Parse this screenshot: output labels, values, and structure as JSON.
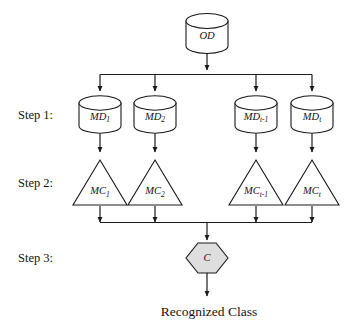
{
  "diagram": {
    "background_color": "#ffffff",
    "stroke_color": "#1a1a1a",
    "hexagon_fill": "#dedede",
    "source": {
      "id": "OD",
      "label": "OD",
      "shape": "cylinder"
    },
    "steps": [
      {
        "id": "step1",
        "label": "Step 1:"
      },
      {
        "id": "step2",
        "label": "Step 2:"
      },
      {
        "id": "step3",
        "label": "Step 3:"
      }
    ],
    "step1_nodes": [
      {
        "id": "md1",
        "base": "MD",
        "sub": "1",
        "shape": "cylinder"
      },
      {
        "id": "md2",
        "base": "MD",
        "sub": "2",
        "shape": "cylinder"
      },
      {
        "id": "mdt1",
        "base": "MD",
        "sub": "t-1",
        "shape": "cylinder"
      },
      {
        "id": "mdt",
        "base": "MD",
        "sub": "t",
        "shape": "cylinder"
      }
    ],
    "step2_nodes": [
      {
        "id": "mc1",
        "base": "MC",
        "sub": "1",
        "shape": "triangle"
      },
      {
        "id": "mc2",
        "base": "MC",
        "sub": "2",
        "shape": "triangle"
      },
      {
        "id": "mct1",
        "base": "MC",
        "sub": "t-1",
        "shape": "triangle"
      },
      {
        "id": "mct",
        "base": "MC",
        "sub": "t",
        "shape": "triangle"
      }
    ],
    "step3_node": {
      "id": "combiner",
      "label": "C",
      "shape": "hexagon"
    },
    "output": {
      "id": "output",
      "label": "Recognized Class"
    }
  }
}
